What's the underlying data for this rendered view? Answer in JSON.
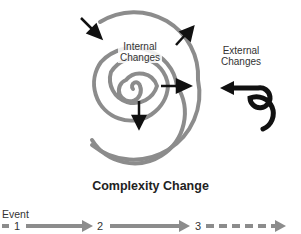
{
  "diagram": {
    "labels": {
      "internal_line1": "Internal",
      "internal_line2": "Changes",
      "external_line1": "External",
      "external_line2": "Changes"
    },
    "title": "Complexity Change",
    "timeline": {
      "label": "Event",
      "events": [
        "1",
        "2",
        "3"
      ],
      "segments": [
        {
          "from": "1",
          "to": "2",
          "style": "solid"
        },
        {
          "from": "2",
          "to": "3",
          "style": "solid"
        },
        {
          "from": "3",
          "to": "future",
          "style": "dashed"
        }
      ]
    },
    "colors": {
      "spiral": "#8c8c8c",
      "arrows": "#111111",
      "timeline": "#8c8c8c"
    }
  }
}
